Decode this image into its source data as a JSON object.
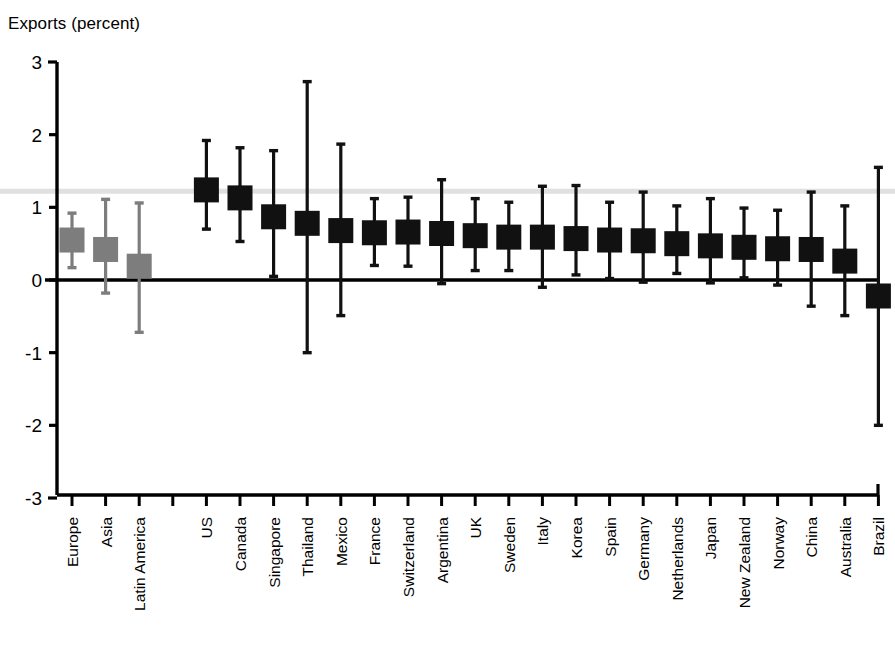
{
  "chart_data": {
    "type": "bar",
    "title": "",
    "ylabel": "Exports (percent)",
    "xlabel": "",
    "ylim": [
      -3,
      3
    ],
    "yticks": [
      3,
      2,
      1,
      0,
      -1,
      -2,
      -3
    ],
    "ytick_labels": [
      "3",
      "2",
      "1",
      "0",
      "-1",
      "-2",
      "-3"
    ],
    "grid": false,
    "legend": null,
    "reference_line_y": 1.22,
    "zero_line_y": 0,
    "marker_style": "square-with-error-bars",
    "colors": {
      "aggregate_marker": "#7d7d7d",
      "country_marker": "#111111",
      "axis": "#000000",
      "reference_line": "#e0e0e0"
    },
    "categories": [
      "Europe",
      "Asia",
      "Latin America",
      "",
      "US",
      "Canada",
      "Singapore",
      "Thailand",
      "Mexico",
      "France",
      "Switzerland",
      "Argentina",
      "UK",
      "Sweden",
      "Italy",
      "Korea",
      "Spain",
      "Germany",
      "Netherlands",
      "Japan",
      "New Zealand",
      "Norway",
      "China",
      "Australia",
      "Brazil"
    ],
    "points": [
      {
        "label": "Europe",
        "group": "aggregate",
        "value": 0.55,
        "low": 0.17,
        "high": 0.92
      },
      {
        "label": "Asia",
        "group": "aggregate",
        "value": 0.42,
        "low": -0.18,
        "high": 1.11
      },
      {
        "label": "Latin America",
        "group": "aggregate",
        "value": 0.19,
        "low": -0.72,
        "high": 1.06
      },
      {
        "label": "US",
        "group": "country",
        "value": 1.24,
        "low": 0.7,
        "high": 1.92
      },
      {
        "label": "Canada",
        "group": "country",
        "value": 1.13,
        "low": 0.53,
        "high": 1.82
      },
      {
        "label": "Singapore",
        "group": "country",
        "value": 0.87,
        "low": 0.05,
        "high": 1.78
      },
      {
        "label": "Thailand",
        "group": "country",
        "value": 0.78,
        "low": -1.0,
        "high": 2.73
      },
      {
        "label": "Mexico",
        "group": "country",
        "value": 0.68,
        "low": -0.49,
        "high": 1.87
      },
      {
        "label": "France",
        "group": "country",
        "value": 0.65,
        "low": 0.2,
        "high": 1.12
      },
      {
        "label": "Switzerland",
        "group": "country",
        "value": 0.66,
        "low": 0.19,
        "high": 1.14
      },
      {
        "label": "Argentina",
        "group": "country",
        "value": 0.64,
        "low": -0.05,
        "high": 1.38
      },
      {
        "label": "UK",
        "group": "country",
        "value": 0.61,
        "low": 0.13,
        "high": 1.12
      },
      {
        "label": "Sweden",
        "group": "country",
        "value": 0.59,
        "low": 0.13,
        "high": 1.07
      },
      {
        "label": "Italy",
        "group": "country",
        "value": 0.59,
        "low": -0.1,
        "high": 1.29
      },
      {
        "label": "Korea",
        "group": "country",
        "value": 0.57,
        "low": 0.07,
        "high": 1.3
      },
      {
        "label": "Spain",
        "group": "country",
        "value": 0.55,
        "low": 0.02,
        "high": 1.07
      },
      {
        "label": "Germany",
        "group": "country",
        "value": 0.54,
        "low": -0.03,
        "high": 1.21
      },
      {
        "label": "Netherlands",
        "group": "country",
        "value": 0.5,
        "low": 0.09,
        "high": 1.02
      },
      {
        "label": "Japan",
        "group": "country",
        "value": 0.47,
        "low": -0.04,
        "high": 1.12
      },
      {
        "label": "New Zealand",
        "group": "country",
        "value": 0.45,
        "low": 0.03,
        "high": 0.99
      },
      {
        "label": "Norway",
        "group": "country",
        "value": 0.43,
        "low": -0.07,
        "high": 0.96
      },
      {
        "label": "China",
        "group": "country",
        "value": 0.42,
        "low": -0.36,
        "high": 1.21
      },
      {
        "label": "Australia",
        "group": "country",
        "value": 0.26,
        "low": -0.49,
        "high": 1.02
      },
      {
        "label": "Brazil",
        "group": "country",
        "value": -0.22,
        "low": -2.0,
        "high": 1.55
      }
    ]
  }
}
